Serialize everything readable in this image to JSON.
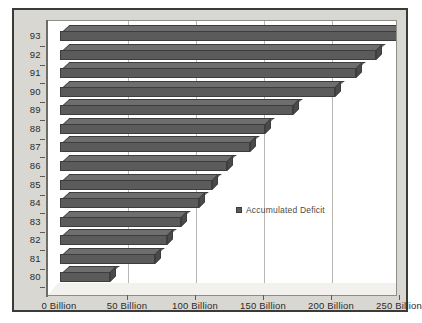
{
  "chart_data": {
    "type": "bar",
    "orientation": "horizontal",
    "title": "",
    "subtitle": "",
    "xlabel": "",
    "ylabel": "",
    "categories": [
      "80",
      "81",
      "82",
      "83",
      "84",
      "85",
      "86",
      "87",
      "88",
      "89",
      "90",
      "91",
      "92",
      "93"
    ],
    "series": [
      {
        "name": "Accumulated Deficit",
        "color": "#5b5b5b",
        "values": [
          37,
          70,
          79,
          89,
          102,
          112,
          123,
          140,
          151,
          171,
          202,
          218,
          232,
          248
        ]
      }
    ],
    "value_unit": "Billion",
    "xlim": [
      0,
      250
    ],
    "x_ticks": [
      0,
      50,
      100,
      150,
      200,
      250
    ],
    "x_tick_labels": [
      "0 Billion",
      "50 Billion",
      "100 Billion",
      "150 Billion",
      "200 Billion",
      "250 Billion"
    ],
    "y_tick_labels": [
      "93",
      "92",
      "91",
      "90",
      "89",
      "88",
      "87",
      "86",
      "85",
      "84",
      "83",
      "82",
      "81",
      "80"
    ],
    "grid": true,
    "grid_axis": "x",
    "legend": {
      "position": "center-right-inside",
      "entries": [
        {
          "label": "Accumulated Deficit",
          "color": "#5b5b5b"
        }
      ]
    },
    "style": {
      "three_d": true,
      "plot_background": "#ffffff",
      "figure_background": "#d9d7d2",
      "frame_color": "#3a3a38",
      "axis_color": "#6d6b66",
      "gridline_color": "#b9b7b2",
      "text_color": "#2b2b29"
    }
  }
}
